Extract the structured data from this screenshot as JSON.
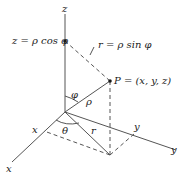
{
  "diagram": {
    "type": "spherical-coordinates",
    "axes": {
      "z_label": "z",
      "x_label": "x",
      "y_label": "y",
      "x_tick_label": "x",
      "y_tick_label": "y"
    },
    "labels": {
      "z_eq": "z = ρ cos φ",
      "r_eq": "r = ρ sin φ",
      "point": "P = (x, y, z)",
      "phi": "φ",
      "rho": "ρ",
      "theta": "θ",
      "r": "r"
    },
    "colors": {
      "line": "#555555",
      "text": "#1a1a1a",
      "background": "#ffffff"
    }
  }
}
